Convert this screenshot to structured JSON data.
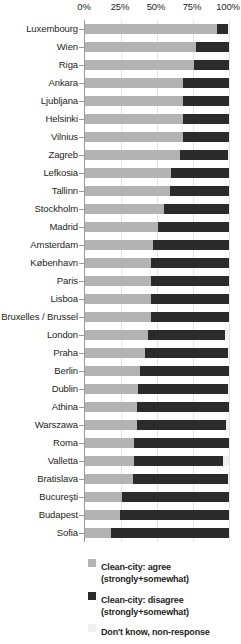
{
  "chart_data": {
    "type": "bar",
    "orientation": "horizontal",
    "stacked": true,
    "title": "",
    "xlabel": "",
    "ylabel": "",
    "xlim": [
      0,
      100
    ],
    "xticks": [
      "0%",
      "25%",
      "50%",
      "75%",
      "100%"
    ],
    "xtick_values": [
      0,
      25,
      50,
      75,
      100
    ],
    "grid": true,
    "legend_position": "bottom",
    "categories": [
      "Luxembourg",
      "Wien",
      "Riga",
      "Ankara",
      "Ljubljana",
      "Helsinki",
      "Vilnius",
      "Zagreb",
      "Lefkosia",
      "Tallinn",
      "Stockholm",
      "Madrid",
      "Amsterdam",
      "København",
      "Paris",
      "Lisboa",
      "Bruxelles / Brussel",
      "London",
      "Praha",
      "Berlin",
      "Dublin",
      "Athina",
      "Warszawa",
      "Roma",
      "Valletta",
      "Bratislava",
      "Bucureşti",
      "Budapest",
      "Sofia"
    ],
    "series": [
      {
        "name": "Clean-city: agree (strongly+somewhat)",
        "color": "#b3b3b3",
        "values": [
          92,
          77,
          76,
          68,
          68,
          68,
          68,
          66,
          60,
          59,
          55,
          51,
          47,
          46,
          46,
          46,
          46,
          44,
          42,
          38,
          37,
          36,
          36,
          34,
          34,
          33,
          26,
          24,
          18
        ]
      },
      {
        "name": "Clean-city: disagree (strongly+somewhat)",
        "color": "#2b2b2b",
        "values": [
          7,
          23,
          24,
          32,
          32,
          32,
          32,
          33,
          40,
          41,
          45,
          49,
          53,
          54,
          54,
          54,
          54,
          53,
          57,
          62,
          62,
          64,
          62,
          66,
          62,
          66,
          74,
          76,
          82
        ]
      },
      {
        "name": "Don't know, non-response",
        "color": "#efefef",
        "values": [
          1,
          0,
          0,
          0,
          0,
          0,
          0,
          1,
          0,
          0,
          0,
          0,
          0,
          0,
          0,
          0,
          0,
          3,
          1,
          0,
          1,
          0,
          2,
          0,
          4,
          1,
          0,
          0,
          0
        ]
      }
    ]
  },
  "legend": {
    "items": [
      {
        "swatch": "sw-agree",
        "line1": "Clean-city: agree",
        "line2": "(strongly+somewhat)"
      },
      {
        "swatch": "sw-disagree",
        "line1": "Clean-city: disagree",
        "line2": "(strongly+somewhat)"
      },
      {
        "swatch": "sw-dk",
        "line1": "Don't know, non-response",
        "line2": ""
      }
    ]
  }
}
